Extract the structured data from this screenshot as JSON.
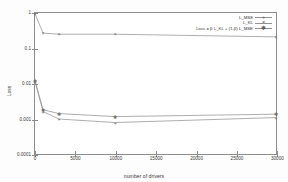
{
  "chart_data": {
    "type": "line",
    "title": "",
    "xlabel": "number of drivers",
    "ylabel": "Loss",
    "xlim": [
      0,
      30000
    ],
    "ylim": [
      0.0001,
      1
    ],
    "yscale": "log",
    "grid": false,
    "legend_position": "top-right",
    "xticks": [
      0,
      5000,
      10000,
      15000,
      20000,
      25000,
      30000
    ],
    "xticklabels": [
      "0",
      "5000",
      "10000",
      "15000",
      "20000",
      "25000",
      "30000"
    ],
    "yticks": [
      1,
      0.1,
      0.01,
      0.001,
      0.0001
    ],
    "yticklabels": [
      "1",
      "0.1",
      "0.01",
      "0.001",
      "0.0001"
    ],
    "x": [
      0,
      1000,
      3000,
      10000,
      30000
    ],
    "series": [
      {
        "name": "L_MSE",
        "marker": "+",
        "values": [
          0.0115,
          0.0016,
          0.00098,
          0.00078,
          0.00108
        ]
      },
      {
        "name": "L_KL",
        "marker": "x",
        "values": [
          0.95,
          0.27,
          0.25,
          0.25,
          0.21
        ]
      },
      {
        "name": "Loss = B L_KL + (1-B) L_MSE",
        "marker": "*",
        "values": [
          0.012,
          0.0018,
          0.0014,
          0.00115,
          0.00135
        ]
      }
    ]
  },
  "legend": {
    "items": [
      {
        "label": "L_MSE",
        "marker": "+"
      },
      {
        "label": "L_KL",
        "marker": "×"
      },
      {
        "label": "Loss = β L_KL + (1-β) L_MSE",
        "marker": "✱"
      }
    ]
  },
  "axes": {
    "y_title": "Loss",
    "x_title": "number of drivers"
  }
}
